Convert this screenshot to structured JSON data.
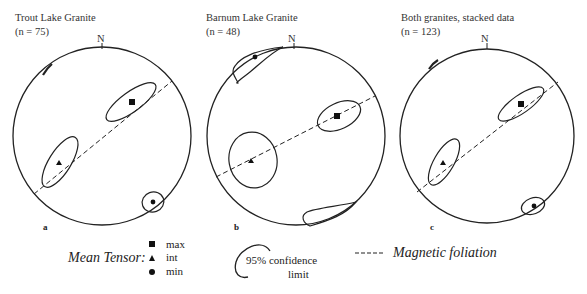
{
  "panels": [
    {
      "id": "a",
      "title": "Trout Lake Granite",
      "n_label": "(n = 75)",
      "north": "N",
      "letter": "a"
    },
    {
      "id": "b",
      "title": "Barnum Lake Granite",
      "n_label": "(n = 48)",
      "north": "N",
      "letter": "b"
    },
    {
      "id": "c",
      "title": "Both granites, stacked data",
      "n_label": "(n = 123)",
      "north": "N",
      "letter": "c"
    }
  ],
  "legend": {
    "mean_tensor_label": "Mean Tensor:",
    "items": [
      {
        "symbol": "square",
        "label": "max"
      },
      {
        "symbol": "triangle",
        "label": "int"
      },
      {
        "symbol": "circle",
        "label": "min"
      }
    ],
    "confidence_line1": "95% confidence",
    "confidence_line2": "limit",
    "foliation_label": "Magnetic foliation"
  }
}
